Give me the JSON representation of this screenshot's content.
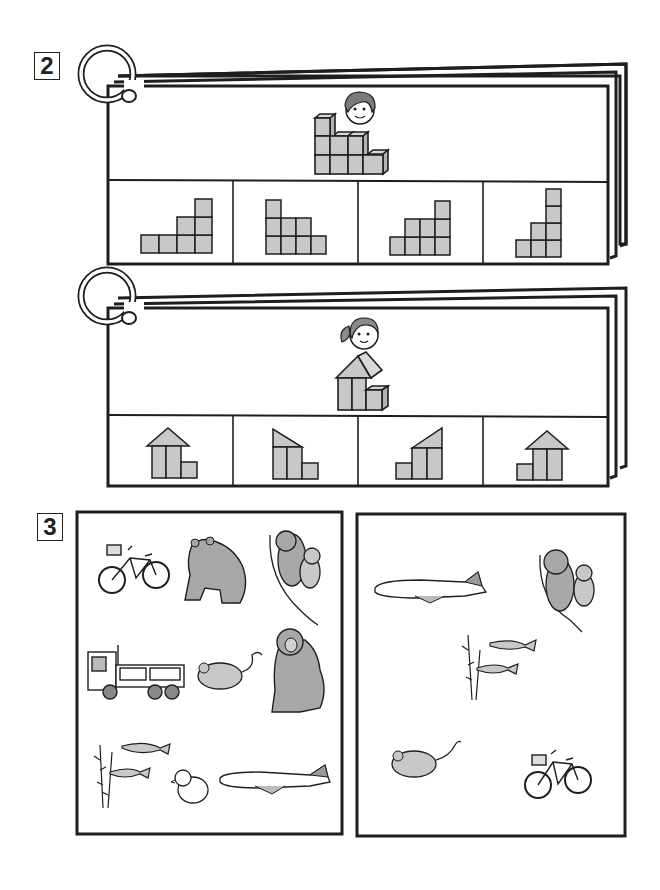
{
  "worksheet": {
    "sections": [
      {
        "number": "2",
        "cards": [
          {
            "name": "boy-blocks-card",
            "character": "boy",
            "model_shape": "staircase of cubes (3 columns: 3, 2, 2 high, plus 1 low cube)",
            "options": [
              {
                "label": "option 1",
                "shape": "steps-left-low (1,1,2,3)"
              },
              {
                "label": "option 2",
                "shape": "steps-right-low (3,2,2,1)"
              },
              {
                "label": "option 3",
                "shape": "steps (1,2,2,3)"
              },
              {
                "label": "option 4",
                "shape": "tall steps (1,2,4)"
              }
            ]
          },
          {
            "name": "girl-blocks-card",
            "character": "girl",
            "model_shape": "house with triangle roof and small cube",
            "options": [
              {
                "label": "option 1",
                "shape": "house roof + cube right"
              },
              {
                "label": "option 2",
                "shape": "half-roof left + cube right"
              },
              {
                "label": "option 3",
                "shape": "half-roof right + cube left"
              },
              {
                "label": "option 4",
                "shape": "house roof + cube left"
              }
            ]
          }
        ]
      },
      {
        "number": "3",
        "panels": [
          {
            "name": "left-picture-panel",
            "items": [
              "bicycle",
              "bear",
              "koalas",
              "truck",
              "mouse",
              "monkey",
              "fish-and-waterweed",
              "chick",
              "airplane"
            ]
          },
          {
            "name": "right-picture-panel",
            "items": [
              "airplane",
              "koalas",
              "fish-and-waterweed",
              "mouse",
              "bicycle"
            ]
          }
        ]
      }
    ],
    "colors": {
      "ink": "#1e1e1e",
      "block_fill": "#c8c8c8",
      "paper": "#ffffff"
    }
  }
}
